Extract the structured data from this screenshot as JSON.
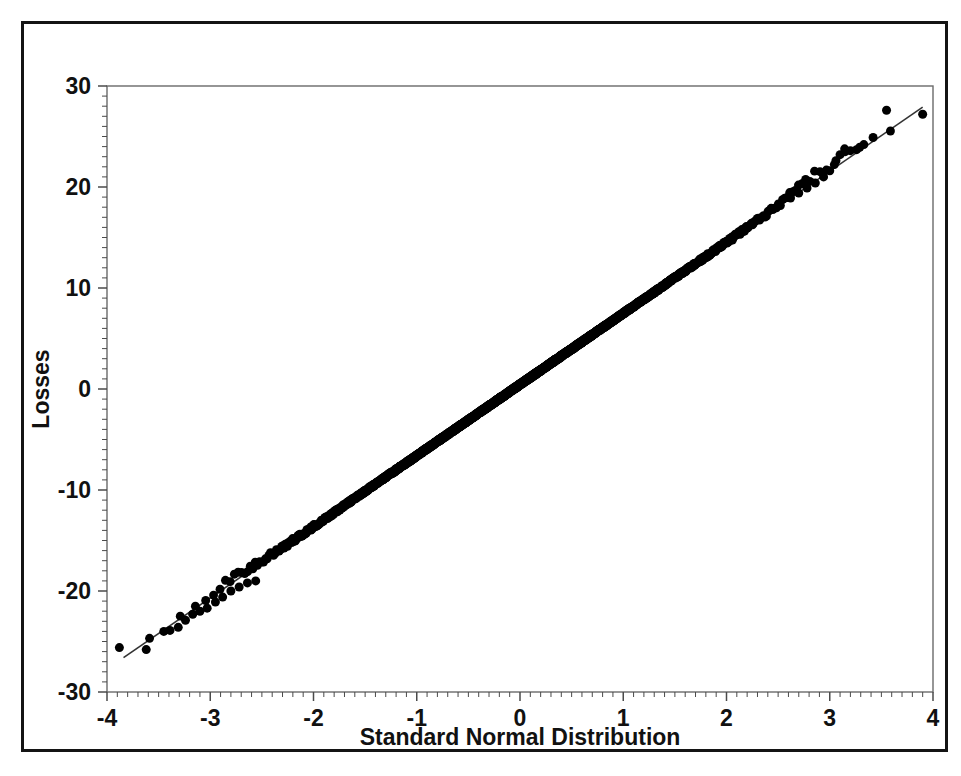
{
  "figure": {
    "background_color": "#ffffff",
    "frame_color": "#141414",
    "axis_color": "#555555",
    "marker_color": "#000000",
    "line_color": "#333333"
  },
  "chart_data": {
    "type": "scatter",
    "title": "",
    "subtitle": "",
    "xlabel": "Standard Normal Distribution",
    "ylabel": "Losses",
    "xlim": [
      -4,
      4
    ],
    "ylim": [
      -30,
      30
    ],
    "grid": false,
    "legend": null,
    "legend_position": "none",
    "x_major_ticks": [
      -4,
      -3,
      -2,
      -1,
      0,
      1,
      2,
      3,
      4
    ],
    "x_tick_labels": [
      "-4",
      "-3",
      "-2",
      "-1",
      "0",
      "1",
      "2",
      "3",
      "4"
    ],
    "x_minor_step": 0.1,
    "y_major_ticks": [
      30,
      20,
      10,
      0,
      -10,
      -20,
      -30
    ],
    "y_tick_labels": [
      "30",
      "20",
      "10",
      "0",
      "-10",
      "-20",
      "-30"
    ],
    "y_minor_step": 1,
    "marker": "filled-circle",
    "marker_size_px": 9,
    "reference_line": {
      "name": "qq-reference-line",
      "x_start": -3.84,
      "y_start": -26.6,
      "x_end": 3.9,
      "y_end": 27.9,
      "slope": 7.04,
      "intercept": 0.44
    },
    "annotations": [
      "Dense central band of overlapping points from about x=-3 to x=3",
      "Lower tail outliers separate below x=-3.4",
      "Upper tail points rise above the reference line near x=3.0 to 3.3",
      "Extreme upper points fall below the line at x=3.55 and x=3.9"
    ],
    "series": [
      {
        "name": "Losses quantiles",
        "n_points": 3000,
        "distribution": "approximately normal with heavy shoulder near +3 sigma",
        "tail_points_low": [
          [
            -3.88,
            -25.6
          ],
          [
            -3.62,
            -25.8
          ],
          [
            -3.45,
            -24.0
          ],
          [
            -3.39,
            -23.9
          ],
          [
            -3.31,
            -23.6
          ],
          [
            -3.24,
            -22.9
          ],
          [
            -3.17,
            -22.3
          ],
          [
            -3.1,
            -22.0
          ],
          [
            -3.03,
            -21.7
          ],
          [
            -2.95,
            -21.1
          ],
          [
            -2.88,
            -20.6
          ],
          [
            -2.8,
            -20.0
          ],
          [
            -2.72,
            -19.6
          ],
          [
            -2.64,
            -19.2
          ],
          [
            -2.56,
            -19.0
          ]
        ],
        "tail_points_high": [
          [
            2.62,
            18.9
          ],
          [
            2.7,
            19.4
          ],
          [
            2.78,
            19.9
          ],
          [
            2.86,
            20.4
          ],
          [
            2.94,
            21.0
          ],
          [
            3.0,
            21.6
          ],
          [
            3.06,
            22.6
          ],
          [
            3.1,
            23.2
          ],
          [
            3.15,
            23.5
          ],
          [
            3.2,
            23.6
          ],
          [
            3.26,
            23.7
          ],
          [
            3.33,
            24.2
          ],
          [
            3.42,
            24.9
          ],
          [
            3.55,
            27.6
          ],
          [
            3.9,
            27.2
          ]
        ]
      }
    ]
  },
  "axes": {
    "x_axis_name": "x-axis",
    "y_axis_name": "y-axis"
  }
}
